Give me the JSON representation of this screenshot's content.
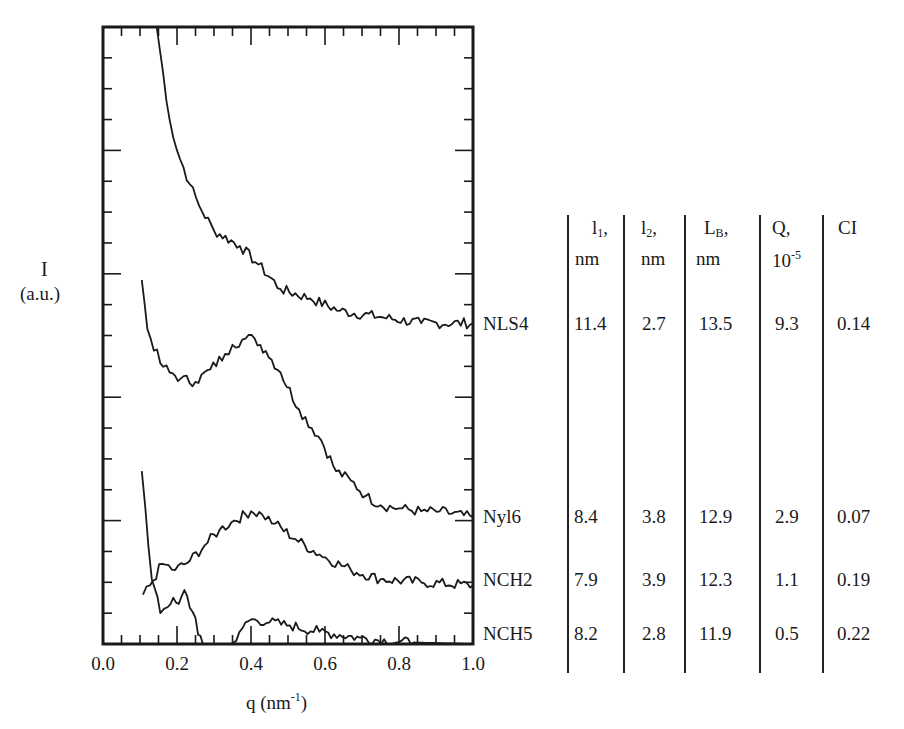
{
  "chart_data": {
    "type": "line",
    "title": "",
    "xlabel": "q (nm-1)",
    "ylabel": "I (a.u.)",
    "xlim": [
      0.0,
      1.0
    ],
    "ylim": [
      0,
      20
    ],
    "x_ticks": [
      "0.0",
      "0.2",
      "0.4",
      "0.6",
      "0.8",
      "1.0"
    ],
    "y_ticks_labeled": false,
    "grid": false,
    "legend_position": "right (curve labels at curve ends)",
    "series": [
      {
        "name": "NLS4",
        "points": [
          [
            0.145,
            20
          ],
          [
            0.18,
            17
          ],
          [
            0.2,
            16
          ],
          [
            0.235,
            14.9
          ],
          [
            0.26,
            14.2
          ],
          [
            0.3,
            13.4
          ],
          [
            0.37,
            12.9
          ],
          [
            0.42,
            12.3
          ],
          [
            0.48,
            11.5
          ],
          [
            0.56,
            11.2
          ],
          [
            0.64,
            10.8
          ],
          [
            0.75,
            10.6
          ],
          [
            0.86,
            10.4
          ],
          [
            1.0,
            10.4
          ]
        ]
      },
      {
        "name": "Nyl6",
        "points": [
          [
            0.105,
            11.8
          ],
          [
            0.12,
            10.2
          ],
          [
            0.155,
            9.1
          ],
          [
            0.18,
            8.8
          ],
          [
            0.21,
            8.6
          ],
          [
            0.25,
            8.5
          ],
          [
            0.29,
            8.9
          ],
          [
            0.33,
            9.4
          ],
          [
            0.35,
            9.7
          ],
          [
            0.385,
            9.9
          ],
          [
            0.41,
            9.9
          ],
          [
            0.44,
            9.5
          ],
          [
            0.48,
            8.8
          ],
          [
            0.53,
            7.6
          ],
          [
            0.59,
            6.6
          ],
          [
            0.63,
            5.6
          ],
          [
            0.67,
            5.3
          ],
          [
            0.71,
            4.8
          ],
          [
            0.75,
            4.5
          ],
          [
            0.8,
            4.4
          ],
          [
            0.86,
            4.3
          ],
          [
            0.91,
            4.3
          ],
          [
            1.0,
            4.1
          ]
        ]
      },
      {
        "name": "NCH2",
        "points": [
          [
            0.108,
            1.6
          ],
          [
            0.127,
            1.9
          ],
          [
            0.16,
            2.6
          ],
          [
            0.195,
            2.4
          ],
          [
            0.235,
            2.7
          ],
          [
            0.275,
            3.2
          ],
          [
            0.315,
            3.7
          ],
          [
            0.355,
            4.0
          ],
          [
            0.4,
            4.3
          ],
          [
            0.43,
            4.2
          ],
          [
            0.465,
            3.9
          ],
          [
            0.52,
            3.4
          ],
          [
            0.585,
            2.9
          ],
          [
            0.67,
            2.4
          ],
          [
            0.75,
            2.1
          ],
          [
            0.86,
            2.0
          ],
          [
            1.0,
            1.9
          ]
        ]
      },
      {
        "name": "NCH5",
        "points": [
          [
            0.105,
            5.6
          ],
          [
            0.132,
            2.1
          ],
          [
            0.155,
            1.0
          ],
          [
            0.175,
            1.2
          ],
          [
            0.19,
            1.5
          ],
          [
            0.205,
            1.3
          ],
          [
            0.22,
            1.75
          ],
          [
            0.25,
            0.85
          ],
          [
            0.257,
            0.3
          ],
          [
            0.27,
            0
          ],
          [
            0.345,
            0
          ],
          [
            0.36,
            0.1
          ],
          [
            0.385,
            0.7
          ],
          [
            0.41,
            0.8
          ],
          [
            0.45,
            0.7
          ],
          [
            0.505,
            0.6
          ],
          [
            0.585,
            0.4
          ],
          [
            0.695,
            0.2
          ],
          [
            0.8,
            0.06
          ],
          [
            1.0,
            0
          ]
        ]
      }
    ],
    "table": {
      "columns": [
        "l1, nm",
        "l2, nm",
        "LB, nm",
        "Q, 10-5",
        "CI"
      ],
      "rows": [
        {
          "sample": "NLS4",
          "values": [
            "11.4",
            "2.7",
            "13.5",
            "9.3",
            "0.14"
          ]
        },
        {
          "sample": "Nyl6",
          "values": [
            "8.4",
            "3.8",
            "12.9",
            "2.9",
            "0.07"
          ]
        },
        {
          "sample": "NCH2",
          "values": [
            "7.9",
            "3.9",
            "12.3",
            "1.1",
            "0.19"
          ]
        },
        {
          "sample": "NCH5",
          "values": [
            "8.2",
            "2.8",
            "11.9",
            "0.5",
            "0.22"
          ]
        }
      ]
    }
  },
  "axis": {
    "y_label_main": "I",
    "y_label_unit": "(a.u.)",
    "x_label_main": "q (nm",
    "x_label_exp": "-1",
    "x_label_close": ")"
  },
  "table_header": {
    "c1_main": "l",
    "c1_sub": "1",
    "c1_tail": ",",
    "c1_unit": "nm",
    "c2_main": "l",
    "c2_sub": "2",
    "c2_tail": ",",
    "c2_unit": "nm",
    "c3_main": "L",
    "c3_sub": "B",
    "c3_tail": ",",
    "c3_unit": "nm",
    "c4_main": "Q,",
    "c4_unit": "10",
    "c4_exp": "-5",
    "c5_main": "CI"
  }
}
